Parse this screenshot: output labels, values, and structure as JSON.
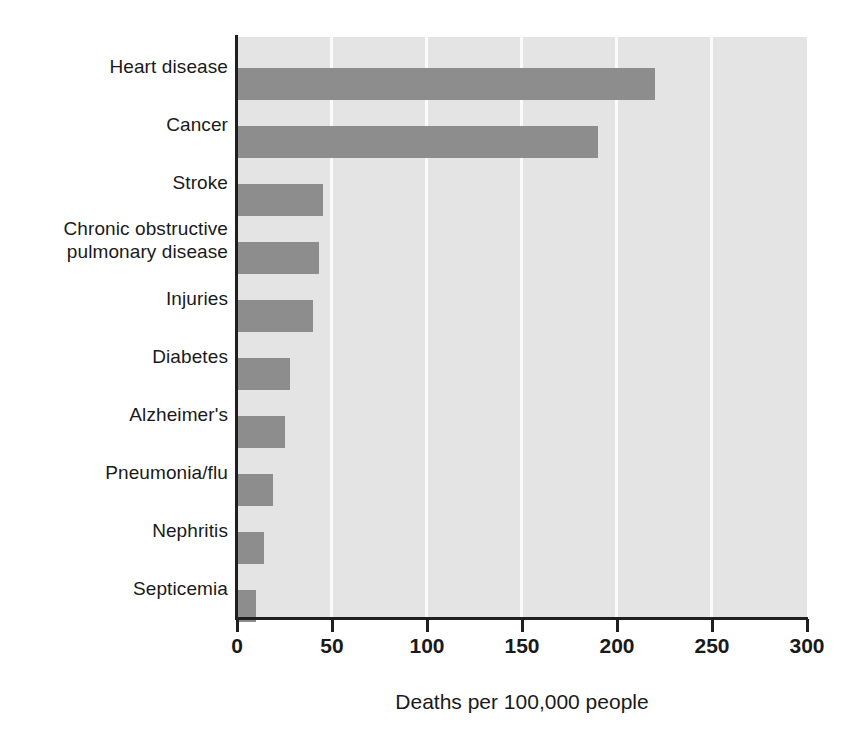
{
  "chart_data": {
    "type": "bar",
    "orientation": "horizontal",
    "title": "",
    "xlabel": "Deaths per 100,000 people",
    "ylabel": "",
    "xlim": [
      0,
      300
    ],
    "xticks": [
      0,
      50,
      100,
      150,
      200,
      250,
      300
    ],
    "xtick_labels": [
      "0",
      "50",
      "100",
      "150",
      "200",
      "250",
      "300"
    ],
    "grid": true,
    "grid_axis": "x",
    "legend": false,
    "categories": [
      "Heart disease",
      "Cancer",
      "Stroke",
      "Chronic obstructive\npulmonary disease",
      "Injuries",
      "Diabetes",
      "Alzheimer's",
      "Pneumonia/flu",
      "Nephritis",
      "Septicemia"
    ],
    "values": [
      220,
      190,
      45,
      43,
      40,
      28,
      25,
      19,
      14,
      10
    ],
    "bar_color": "#8d8d8d",
    "plot_background": "#e4e4e4",
    "gridline_color": "#fbfbfb",
    "axis_color": "#1f1f1f"
  },
  "axis": {
    "x_title": "Deaths per 100,000 people"
  }
}
